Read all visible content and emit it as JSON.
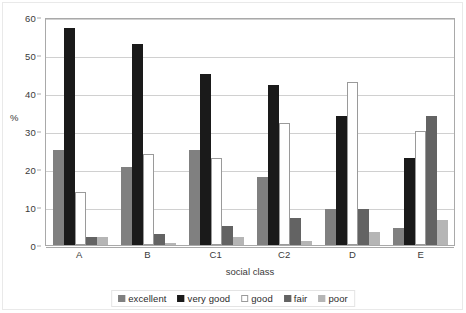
{
  "chart_data": {
    "type": "bar",
    "title": "",
    "subtitle": "",
    "xlabel": "social class",
    "ylabel": "%",
    "categories": [
      "A",
      "B",
      "C1",
      "C2",
      "D",
      "E"
    ],
    "ylim": [
      0,
      60
    ],
    "yticks": [
      0,
      10,
      20,
      30,
      40,
      50,
      60
    ],
    "ytick_labels": [
      "0",
      "10",
      "20",
      "30",
      "40",
      "50",
      "60"
    ],
    "grid": true,
    "legend_position": "bottom",
    "series": [
      {
        "name": "excellent",
        "color": "#808080",
        "border": "#808080",
        "values": [
          25,
          20.5,
          25,
          18,
          9.5,
          4.5
        ]
      },
      {
        "name": "very good",
        "color": "#1a1a1a",
        "border": "#1a1a1a",
        "values": [
          57,
          53,
          45,
          42,
          34,
          23
        ]
      },
      {
        "name": "good",
        "color": "#ffffff",
        "border": "#9a9a9a",
        "values": [
          14,
          24,
          23,
          32,
          43,
          30
        ]
      },
      {
        "name": "fair",
        "color": "#636363",
        "border": "#636363",
        "values": [
          2,
          3,
          5,
          7,
          9.5,
          34
        ]
      },
      {
        "name": "poor",
        "color": "#b5b5b5",
        "border": "#b5b5b5",
        "values": [
          2,
          0.3,
          2,
          1,
          3.5,
          6.5
        ]
      }
    ]
  },
  "legend": {
    "items": [
      {
        "label": "excellent"
      },
      {
        "label": "very good"
      },
      {
        "label": "good"
      },
      {
        "label": "fair"
      },
      {
        "label": "poor"
      }
    ]
  }
}
